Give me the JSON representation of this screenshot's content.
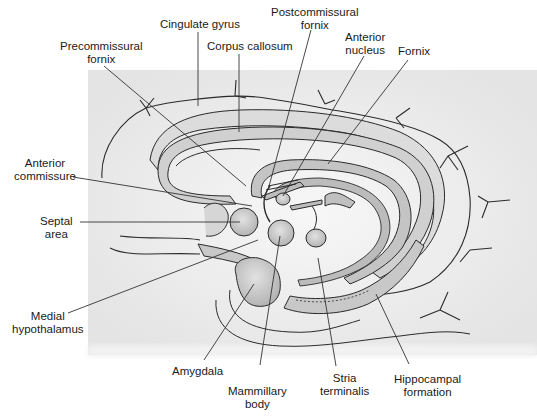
{
  "diagram": {
    "background_color": "#ffffff",
    "panel_color": "#ececec",
    "line_color": "#2a2a2a",
    "structure_fill": "#c8c8c8"
  },
  "labels": {
    "cingulate_gyrus": {
      "line1": "Cingulate gyrus"
    },
    "precommissural_fornix": {
      "line1": "Precommissural",
      "line2": "fornix"
    },
    "corpus_callosum": {
      "line1": "Corpus callosum"
    },
    "postcommissural_fornix": {
      "line1": "Postcommissural",
      "line2": "fornix"
    },
    "anterior_nucleus": {
      "line1": "Anterior",
      "line2": "nucleus"
    },
    "fornix": {
      "line1": "Fornix"
    },
    "anterior_commissure": {
      "line1": "Anterior",
      "line2": "commissure"
    },
    "septal_area": {
      "line1": "Septal",
      "line2": "area"
    },
    "medial_hypothalamus": {
      "line1": "Medial",
      "line2": "hypothalamus"
    },
    "amygdala": {
      "line1": "Amygdala"
    },
    "mammillary_body": {
      "line1": "Mammillary",
      "line2": "body"
    },
    "stria_terminalis": {
      "line1": "Stria",
      "line2": "terminalis"
    },
    "hippocampal_formation": {
      "line1": "Hippocampal",
      "line2": "formation"
    }
  }
}
